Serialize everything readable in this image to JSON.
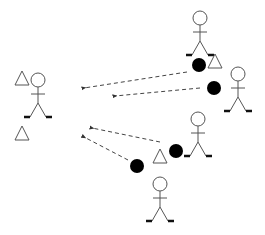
{
  "diagram": {
    "title": "",
    "colors": {
      "stroke": "#555555",
      "ball": "#000000",
      "background": "#ffffff",
      "arrow": "#444444"
    },
    "figures": [
      {
        "id": "receiver",
        "x": 38,
        "y": 80
      },
      {
        "id": "top",
        "x": 200,
        "y": 18
      },
      {
        "id": "right",
        "x": 238,
        "y": 74
      },
      {
        "id": "middle",
        "x": 198,
        "y": 119
      },
      {
        "id": "bottom",
        "x": 160,
        "y": 184
      }
    ],
    "triangles": [
      {
        "id": "receiver-tri-1",
        "x": 22,
        "y": 79
      },
      {
        "id": "receiver-tri-2",
        "x": 22,
        "y": 134
      },
      {
        "id": "top-tri",
        "x": 215,
        "y": 62
      },
      {
        "id": "bottom-tri",
        "x": 160,
        "y": 157
      }
    ],
    "balls": [
      {
        "id": "ball-1",
        "x": 199,
        "y": 65
      },
      {
        "id": "ball-2",
        "x": 214,
        "y": 88
      },
      {
        "id": "ball-3",
        "x": 176,
        "y": 151
      },
      {
        "id": "ball-4",
        "x": 137,
        "y": 166
      }
    ],
    "arrows": [
      {
        "id": "arrow-1",
        "x1": 187,
        "y1": 72,
        "x2": 84,
        "y2": 88
      },
      {
        "id": "arrow-2",
        "x1": 200,
        "y1": 88,
        "x2": 115,
        "y2": 96
      },
      {
        "id": "arrow-3",
        "x1": 160,
        "y1": 142,
        "x2": 92,
        "y2": 128
      },
      {
        "id": "arrow-4",
        "x1": 128,
        "y1": 160,
        "x2": 84,
        "y2": 137
      }
    ]
  }
}
